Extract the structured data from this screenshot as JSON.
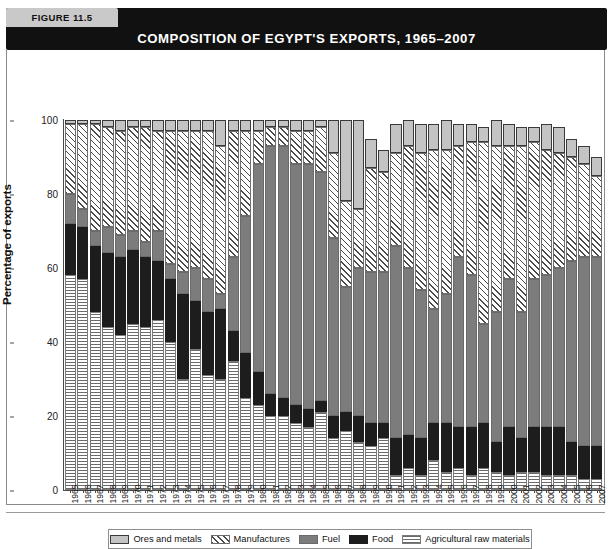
{
  "figure": {
    "tag": "FIGURE 11.5",
    "title": "COMPOSITION OF EGYPT'S EXPORTS, 1965–2007"
  },
  "legend": {
    "items": [
      {
        "label": "Ores and metals",
        "key": "ores",
        "color": "#c4c4c4",
        "pattern": "solid-light-gray"
      },
      {
        "label": "Manufactures",
        "key": "manufactures",
        "color": "#ffffff",
        "pattern": "diagonal-hatch"
      },
      {
        "label": "Fuel",
        "key": "fuel",
        "color": "#7c7c7c",
        "pattern": "solid-medium-gray"
      },
      {
        "label": "Food",
        "key": "food",
        "color": "#1d1d1d",
        "pattern": "solid-black"
      },
      {
        "label": "Agricultural raw materials",
        "key": "agricultural",
        "color": "#ffffff",
        "pattern": "crosshatch"
      }
    ]
  },
  "axes": {
    "y_title": "Percentage of exports",
    "y_ticks": [
      0,
      20,
      40,
      60,
      80,
      100
    ],
    "y_min": 0,
    "y_max": 100,
    "x_title": ""
  },
  "chart_data": {
    "type": "bar",
    "subtype": "stacked-vertical",
    "title": "COMPOSITION OF EGYPT'S EXPORTS, 1965–2007",
    "xlabel": "",
    "ylabel": "Percentage of exports",
    "ylim": [
      0,
      100
    ],
    "grid": false,
    "legend_position": "bottom",
    "stack_order_bottom_to_top": [
      "agricultural",
      "food",
      "fuel",
      "manufactures",
      "ores"
    ],
    "categories": [
      "1965",
      "1966",
      "1967",
      "1968",
      "1969",
      "1970",
      "1971",
      "1972",
      "1973",
      "1974",
      "1975",
      "1976",
      "1977",
      "1978",
      "1979",
      "1980",
      "1981",
      "1982",
      "1983",
      "1984",
      "1985",
      "1986",
      "1987",
      "1988",
      "1989",
      "1990",
      "1991",
      "1992",
      "1993",
      "1994",
      "1995",
      "1996",
      "1997",
      "1998",
      "1999",
      "2000",
      "2001",
      "2002",
      "2003",
      "2004",
      "2005",
      "2006",
      "2007"
    ],
    "series": [
      {
        "name": "Agricultural raw materials",
        "key": "agricultural",
        "values": [
          58,
          57,
          48,
          44,
          42,
          45,
          44,
          46,
          40,
          30,
          38,
          31,
          30,
          35,
          25,
          23,
          20,
          20,
          18,
          17,
          21,
          14,
          16,
          13,
          12,
          14,
          4,
          6,
          4,
          8,
          5,
          6,
          4,
          6,
          5,
          4,
          5,
          5,
          4,
          4,
          4,
          3,
          3
        ]
      },
      {
        "name": "Food",
        "key": "food",
        "values": [
          14,
          14,
          18,
          20,
          21,
          20,
          19,
          16,
          17,
          23,
          13,
          17,
          19,
          8,
          12,
          9,
          6,
          5,
          5,
          5,
          3,
          6,
          5,
          7,
          6,
          4,
          10,
          9,
          10,
          10,
          13,
          11,
          13,
          12,
          8,
          13,
          9,
          12,
          13,
          13,
          9,
          9,
          9
        ]
      },
      {
        "name": "Fuel",
        "key": "fuel",
        "values": [
          8,
          5,
          4,
          7,
          6,
          5,
          4,
          8,
          4,
          6,
          9,
          9,
          4,
          20,
          37,
          56,
          67,
          68,
          65,
          66,
          62,
          48,
          34,
          40,
          41,
          41,
          52,
          45,
          40,
          31,
          35,
          46,
          41,
          27,
          35,
          40,
          34,
          40,
          41,
          43,
          49,
          51,
          51
        ]
      },
      {
        "name": "Manufactures",
        "key": "manufactures",
        "values": [
          19,
          23,
          29,
          27,
          28,
          28,
          31,
          27,
          36,
          38,
          37,
          40,
          40,
          34,
          23,
          9,
          5,
          5,
          9,
          9,
          12,
          23,
          23,
          16,
          28,
          27,
          25,
          33,
          37,
          43,
          39,
          30,
          36,
          49,
          45,
          36,
          45,
          37,
          34,
          31,
          28,
          25,
          22
        ]
      },
      {
        "name": "Ores and metals",
        "key": "ores",
        "values": [
          1,
          1,
          1,
          2,
          3,
          2,
          2,
          3,
          3,
          3,
          3,
          3,
          7,
          3,
          3,
          3,
          2,
          2,
          3,
          3,
          2,
          9,
          22,
          24,
          8,
          6,
          8,
          7,
          8,
          7,
          8,
          6,
          5,
          4,
          7,
          6,
          5,
          4,
          7,
          7,
          5,
          5,
          5
        ]
      }
    ]
  }
}
